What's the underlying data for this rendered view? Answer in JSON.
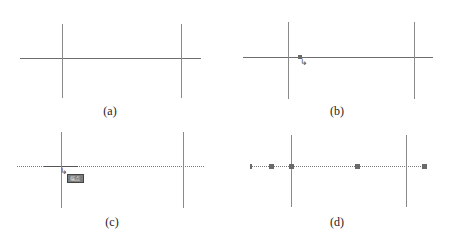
{
  "panels": [
    {
      "id": "a",
      "caption": "(a)",
      "state": "two vertical lines crossed by a horizontal line"
    },
    {
      "id": "b",
      "caption": "(b)",
      "state": "cursor hovering horizontal line near left intersection"
    },
    {
      "id": "c",
      "caption": "(c)",
      "state": "horizontal line selected (dotted) with snap tooltip",
      "tooltip_label": "端点"
    },
    {
      "id": "d",
      "caption": "(d)",
      "state": "horizontal line selected showing grip points"
    }
  ],
  "colors": {
    "line": "#6e6e6e",
    "grip": "#6a6a6a",
    "tooltip_bg": "#7d7d7d"
  }
}
